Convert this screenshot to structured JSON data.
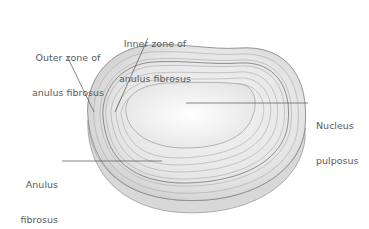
{
  "figure": {
    "labels": [
      {
        "id": "outer-zone",
        "line1": "Outer zone of",
        "line2": "anulus fibrosus"
      },
      {
        "id": "inner-zone",
        "line1": "Inner zone of",
        "line2": "anulus fibrosus"
      },
      {
        "id": "nucleus",
        "line1": "Nucleus",
        "line2": "pulposus"
      },
      {
        "id": "anulus",
        "line1": "Anulus",
        "line2": "fibrosus"
      }
    ],
    "colors": {
      "background": "#ffffff",
      "label_text": "#5a5a5a",
      "leader_line": "#555555",
      "disc_fill": "#eeeeee",
      "ring_stroke": "#a8a8a8",
      "nucleus_fill": "#f7f7f7"
    }
  }
}
